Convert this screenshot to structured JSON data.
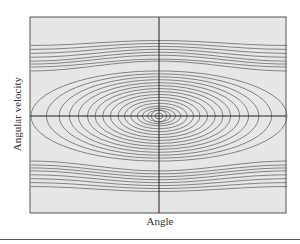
{
  "chart_data": {
    "type": "line",
    "title": "",
    "xlabel": "Angle",
    "ylabel": "Angular velocity",
    "grid": false,
    "legend": null,
    "axes": {
      "x_axis_at": 0,
      "y_axis_at": 0,
      "xlim": [
        -1,
        1
      ],
      "ylim": [
        -1,
        1
      ],
      "ticks": "none"
    },
    "closed_orbits": [
      {
        "a": 0.03,
        "b": 0.03
      },
      {
        "a": 0.06,
        "b": 0.06
      },
      {
        "a": 0.09,
        "b": 0.06
      },
      {
        "a": 0.13,
        "b": 0.08
      },
      {
        "a": 0.17,
        "b": 0.1
      },
      {
        "a": 0.22,
        "b": 0.13
      },
      {
        "a": 0.27,
        "b": 0.16
      },
      {
        "a": 0.32,
        "b": 0.19
      },
      {
        "a": 0.38,
        "b": 0.22
      },
      {
        "a": 0.44,
        "b": 0.25
      },
      {
        "a": 0.5,
        "b": 0.28
      },
      {
        "a": 0.56,
        "b": 0.31
      },
      {
        "a": 0.63,
        "b": 0.34
      },
      {
        "a": 0.7,
        "b": 0.37
      },
      {
        "a": 0.78,
        "b": 0.4
      },
      {
        "a": 0.88,
        "b": 0.43
      },
      {
        "a": 1.0,
        "b": 0.46
      }
    ],
    "open_trajectories": [
      {
        "side": "upper",
        "edge": 0.46,
        "center": 0.56
      },
      {
        "side": "upper",
        "edge": 0.5,
        "center": 0.58
      },
      {
        "side": "upper",
        "edge": 0.53,
        "center": 0.62
      },
      {
        "side": "upper",
        "edge": 0.56,
        "center": 0.65
      },
      {
        "side": "upper",
        "edge": 0.6,
        "center": 0.68
      },
      {
        "side": "upper",
        "edge": 0.64,
        "center": 0.71
      },
      {
        "side": "upper",
        "edge": 0.68,
        "center": 0.74
      },
      {
        "side": "upper",
        "edge": 0.72,
        "center": 0.77
      },
      {
        "side": "lower",
        "edge": -0.46,
        "center": -0.56
      },
      {
        "side": "lower",
        "edge": -0.5,
        "center": -0.59
      },
      {
        "side": "lower",
        "edge": -0.53,
        "center": -0.62
      },
      {
        "side": "lower",
        "edge": -0.56,
        "center": -0.65
      },
      {
        "side": "lower",
        "edge": -0.6,
        "center": -0.68
      },
      {
        "side": "lower",
        "edge": -0.64,
        "center": -0.71
      },
      {
        "side": "lower",
        "edge": -0.68,
        "center": -0.74
      },
      {
        "side": "lower",
        "edge": -0.72,
        "center": -0.77
      }
    ],
    "colors": {
      "plot_bg": "#e6e6e6",
      "line": "#5a5a5a",
      "axis": "#222222",
      "frame": "#555555"
    }
  }
}
